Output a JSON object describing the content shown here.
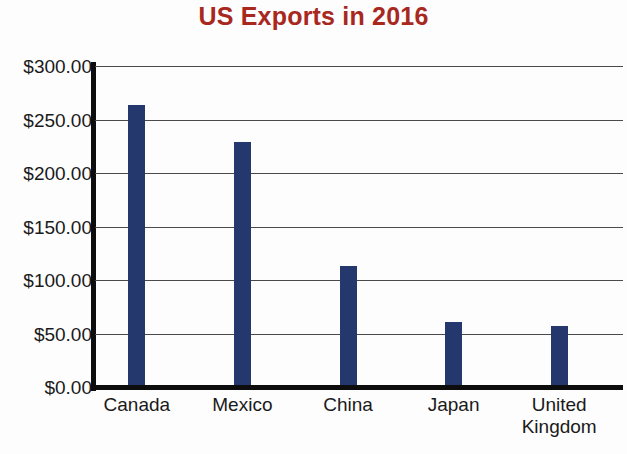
{
  "chart_data": {
    "type": "bar",
    "title": "US Exports in 2016",
    "xlabel": "",
    "ylabel": "",
    "categories": [
      "Canada",
      "Mexico",
      "China",
      "Japan",
      "United Kingdom"
    ],
    "values": [
      264,
      229,
      113,
      61,
      57
    ],
    "ytick_labels": [
      "$300.00",
      "$250.00",
      "$200.00",
      "$150.00",
      "$100.00",
      "$50.00",
      "$0.00"
    ],
    "ytick_values": [
      300,
      250,
      200,
      150,
      100,
      50,
      0
    ],
    "ylim": [
      0,
      300
    ],
    "grid": true,
    "legend": false,
    "bar_color": "#25386e",
    "title_color": "#a8281e",
    "axis_color": "#0d0d0d",
    "gridline_color": "#4a4a4a"
  }
}
